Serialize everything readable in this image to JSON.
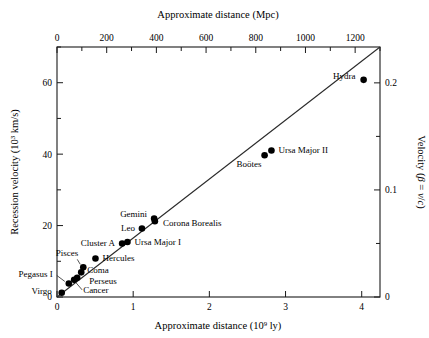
{
  "axes": {
    "top": {
      "title_main": "Approximate distance",
      "title_unit": "(Mpc)",
      "ticks": [
        "0",
        "200",
        "400",
        "600",
        "800",
        "1000",
        "1200"
      ],
      "tick_values": [
        0,
        200,
        400,
        600,
        800,
        1000,
        1200
      ],
      "range": [
        0,
        1300
      ]
    },
    "bottom": {
      "title_main": "Approximate distance (10",
      "title_sup": "9",
      "title_tail": " ly)",
      "ticks": [
        "0",
        "1",
        "2",
        "3",
        "4"
      ],
      "tick_values": [
        0,
        1,
        2,
        3,
        4
      ],
      "range": [
        0,
        4.24
      ]
    },
    "left": {
      "title_main": "Recession velocity (10",
      "title_sup": "3",
      "title_tail": " km/s)",
      "ticks": [
        "0",
        "20",
        "40",
        "60"
      ],
      "tick_values": [
        0,
        20,
        40,
        60
      ],
      "range": [
        0,
        70
      ]
    },
    "right": {
      "title_pre": "Velocity (",
      "title_beta": "β",
      "title_eq": " = ",
      "title_v": "v",
      "title_slash": "/",
      "title_c": "c",
      "title_post": ")",
      "ticks": [
        "0",
        "0.1",
        "0.2"
      ],
      "tick_values": [
        0,
        0.1,
        0.2
      ],
      "range": [
        0,
        0.2335
      ]
    }
  },
  "chart_data": {
    "type": "scatter",
    "title": "",
    "xlabel": "Approximate distance (10^9 ly)",
    "ylabel": "Recession velocity (10^3 km/s)",
    "xlabel_top": "Approximate distance (Mpc)",
    "ylabel_right": "Velocity (β = v/c)",
    "xlim": [
      0,
      4.24
    ],
    "ylim": [
      0,
      70
    ],
    "grid": false,
    "legend": false,
    "fit_line": {
      "x": [
        0.0,
        4.24
      ],
      "y": [
        0.0,
        70.0
      ],
      "label": "Hubble law"
    },
    "points": [
      {
        "name": "Virgo",
        "x": 0.062,
        "y": 1.2,
        "label_pos": "left"
      },
      {
        "name": "Pegasus I",
        "x": 0.155,
        "y": 3.8,
        "label_pos": "left"
      },
      {
        "name": "Cancer",
        "x": 0.225,
        "y": 4.8,
        "label_pos": "right"
      },
      {
        "name": "Perseus",
        "x": 0.265,
        "y": 5.4,
        "label_pos": "right"
      },
      {
        "name": "Coma",
        "x": 0.318,
        "y": 6.9,
        "label_pos": "right"
      },
      {
        "name": "Pisces",
        "x": 0.345,
        "y": 8.3,
        "label_pos": "left"
      },
      {
        "name": "Hercules",
        "x": 0.505,
        "y": 10.8,
        "label_pos": "right"
      },
      {
        "name": "Cluster A",
        "x": 0.855,
        "y": 15.0,
        "label_pos": "left"
      },
      {
        "name": "Ursa Major I",
        "x": 0.925,
        "y": 15.4,
        "label_pos": "right"
      },
      {
        "name": "Leo",
        "x": 1.115,
        "y": 19.2,
        "label_pos": "left"
      },
      {
        "name": "Gemini",
        "x": 1.275,
        "y": 22.0,
        "label_pos": "left"
      },
      {
        "name": "Corona Borealis",
        "x": 1.285,
        "y": 21.2,
        "label_pos": "right"
      },
      {
        "name": "Boötes",
        "x": 2.725,
        "y": 39.7,
        "label_pos": "below"
      },
      {
        "name": "Ursa Major II",
        "x": 2.815,
        "y": 41.0,
        "label_pos": "right"
      },
      {
        "name": "Hydra",
        "x": 4.025,
        "y": 60.8,
        "label_pos": "left"
      }
    ]
  },
  "colors": {
    "frame": "#1a1a1a",
    "point": "#000000",
    "line": "#2a2a2a",
    "text": "#111111",
    "background": "#ffffff"
  }
}
